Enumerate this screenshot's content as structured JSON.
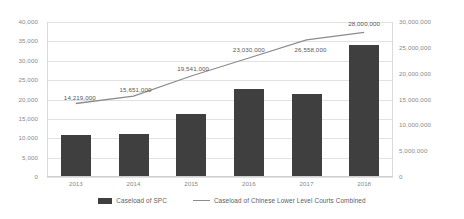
{
  "chart_data": {
    "type": "bar",
    "title": "",
    "xlabel": "",
    "ylabel": "",
    "grid": true,
    "legend_position": "bottom",
    "categories": [
      "2013",
      "2014",
      "2015",
      "2016",
      "2017",
      "2018"
    ],
    "axes": {
      "left": {
        "label": "",
        "min": 0,
        "max": 40000,
        "step": 5000,
        "ticks": [
          "0",
          "5,000",
          "10,000",
          "15,000",
          "20,000",
          "25,000",
          "30,000",
          "35,000",
          "40,000"
        ]
      },
      "right": {
        "label": "",
        "min": 0,
        "max": 30000000,
        "step": 5000000,
        "ticks": [
          "0",
          "5,000,000",
          "10,000,000",
          "15,000,000",
          "20,000,000",
          "25,000,000",
          "30,000,000"
        ]
      }
    },
    "series": [
      {
        "name": "Caseload of SPC",
        "type": "bar",
        "axis": "left",
        "color": "#3f3f3f",
        "values": [
          10800,
          11000,
          16300,
          22700,
          21500,
          34000
        ]
      },
      {
        "name": "Caseload of Chinese Lower Level Courts Combined",
        "type": "line",
        "axis": "right",
        "color": "#8c8c8c",
        "values": [
          14219000,
          15651000,
          19541000,
          23030000,
          26558000,
          28000000
        ],
        "data_labels": [
          "14,219,000",
          "15,651,000",
          "19,541,000",
          "23,030,000",
          "26,558,000",
          "28,000,000"
        ]
      }
    ]
  },
  "legend": {
    "items": [
      {
        "label": "Caseload of SPC",
        "marker": "bar-swatch"
      },
      {
        "label": "Caseload of Chinese Lower Level Courts Combined",
        "marker": "line-swatch"
      }
    ]
  }
}
